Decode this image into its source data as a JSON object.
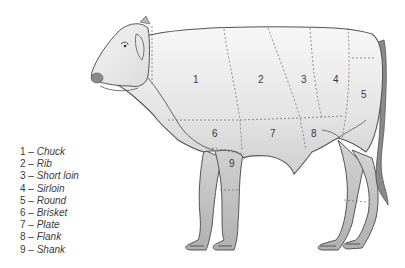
{
  "diagram": {
    "cut_labels": [
      {
        "num": "1",
        "x": 196,
        "y": 80
      },
      {
        "num": "2",
        "x": 261,
        "y": 80
      },
      {
        "num": "3",
        "x": 304,
        "y": 80
      },
      {
        "num": "4",
        "x": 336,
        "y": 80
      },
      {
        "num": "5",
        "x": 364,
        "y": 95
      },
      {
        "num": "6",
        "x": 215,
        "y": 134
      },
      {
        "num": "7",
        "x": 273,
        "y": 134
      },
      {
        "num": "8",
        "x": 314,
        "y": 134
      },
      {
        "num": "9",
        "x": 232,
        "y": 164
      }
    ]
  },
  "legend": {
    "items": [
      {
        "num": "1",
        "separator": " – ",
        "name": "Chuck"
      },
      {
        "num": "2",
        "separator": " – ",
        "name": "Rib"
      },
      {
        "num": "3",
        "separator": " – ",
        "name": "Short loin"
      },
      {
        "num": "4",
        "separator": " – ",
        "name": "Sirloin"
      },
      {
        "num": "5",
        "separator": " – ",
        "name": "Round"
      },
      {
        "num": "6",
        "separator": " – ",
        "name": "Brisket"
      },
      {
        "num": "7",
        "separator": " – ",
        "name": "Plate"
      },
      {
        "num": "8",
        "separator": " – ",
        "name": "Flank"
      },
      {
        "num": "9",
        "separator": " – ",
        "name": "Shank"
      }
    ]
  },
  "colors": {
    "outline": "#555555",
    "body_light": "#f2f2f2",
    "body_mid": "#d6d6d6",
    "leg": "#bdbdbd",
    "tail": "#8a8a8a",
    "text": "#3a3a3a"
  }
}
